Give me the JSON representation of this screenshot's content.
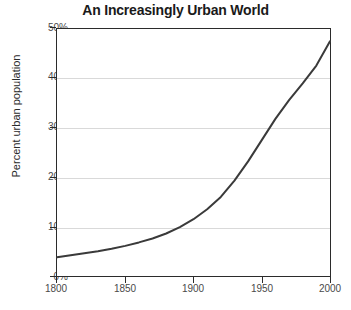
{
  "chart_data": {
    "type": "line",
    "title": "An Increasingly Urban World",
    "xlabel": "",
    "ylabel": "Percent urban population",
    "xlim": [
      1800,
      2000
    ],
    "ylim": [
      0,
      50
    ],
    "xticks": [
      1800,
      1850,
      1900,
      1950,
      2000
    ],
    "xtick_labels": [
      "1800",
      "1850",
      "1900",
      "1950",
      "2000"
    ],
    "yticks": [
      0,
      10,
      20,
      30,
      40,
      50
    ],
    "ytick_labels": [
      "0%",
      "10%",
      "20%",
      "30%",
      "40%",
      "50%"
    ],
    "grid": "horizontal",
    "legend": "none",
    "series": [
      {
        "name": "Percent urban population",
        "color": "#3a3a3a",
        "x": [
          1800,
          1810,
          1820,
          1830,
          1840,
          1850,
          1860,
          1870,
          1880,
          1890,
          1900,
          1910,
          1920,
          1930,
          1940,
          1950,
          1960,
          1970,
          1980,
          1990,
          2000
        ],
        "values": [
          3.8,
          4.2,
          4.6,
          5.0,
          5.5,
          6.1,
          6.8,
          7.6,
          8.6,
          9.9,
          11.5,
          13.5,
          16.0,
          19.3,
          23.2,
          27.5,
          31.8,
          35.6,
          39.0,
          42.6,
          47.5
        ]
      }
    ],
    "annotations": []
  },
  "axis": {
    "y_title": "Percent urban population"
  }
}
